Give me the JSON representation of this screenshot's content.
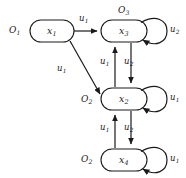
{
  "diagram": {
    "type": "state-transition-diagram",
    "title": "",
    "width": 186,
    "height": 178,
    "stroke_color": "#1a1a1a",
    "text_color": "#1a1a1a",
    "background_color": "#ffffff",
    "states": [
      {
        "id": "x1",
        "state_label": "x",
        "state_sub": "1",
        "output_label": "O",
        "output_sub": "1",
        "output_position": "left",
        "cx": 52,
        "cy": 31,
        "w": 44,
        "h": 22
      },
      {
        "id": "x3",
        "state_label": "x",
        "state_sub": "3",
        "output_label": "O",
        "output_sub": "3",
        "output_position": "top",
        "cx": 124,
        "cy": 31,
        "w": 46,
        "h": 22
      },
      {
        "id": "x2",
        "state_label": "x",
        "state_sub": "2",
        "output_label": "O",
        "output_sub": "2",
        "output_position": "left",
        "cx": 124,
        "cy": 99,
        "w": 46,
        "h": 22
      },
      {
        "id": "x4",
        "state_label": "x",
        "state_sub": "4",
        "output_label": "O",
        "output_sub": "2",
        "output_position": "left",
        "cx": 124,
        "cy": 160,
        "w": 46,
        "h": 22
      }
    ],
    "transitions": [
      {
        "from": "x1",
        "to": "x3",
        "input_label": "u",
        "input_sub": "1",
        "kind": "horizontal",
        "label_x": 80,
        "label_y": 18
      },
      {
        "from": "x1",
        "to": "x2",
        "input_label": "u",
        "input_sub": "1",
        "kind": "diagonal",
        "label_x": 61,
        "label_y": 68
      },
      {
        "from": "x2",
        "to": "x3",
        "input_label": "u",
        "input_sub": "1",
        "kind": "vertical-up",
        "label_x": 103,
        "label_y": 60
      },
      {
        "from": "x3",
        "to": "x2",
        "input_label": "u",
        "input_sub": "2",
        "kind": "vertical-down",
        "label_x": 128,
        "label_y": 60
      },
      {
        "from": "x4",
        "to": "x2",
        "input_label": "u",
        "input_sub": "1",
        "kind": "vertical-up",
        "label_x": 103,
        "label_y": 126
      },
      {
        "from": "x2",
        "to": "x4",
        "input_label": "u",
        "input_sub": "2",
        "kind": "vertical-down",
        "label_x": 128,
        "label_y": 126
      }
    ],
    "self_loops": [
      {
        "state": "x3",
        "input_label": "u",
        "input_sub": "2",
        "label_x": 171,
        "label_y": 27
      },
      {
        "state": "x2",
        "input_label": "u",
        "input_sub": "1",
        "label_x": 171,
        "label_y": 95
      },
      {
        "state": "x4",
        "input_label": "u",
        "input_sub": "1",
        "label_x": 171,
        "label_y": 156
      }
    ]
  }
}
